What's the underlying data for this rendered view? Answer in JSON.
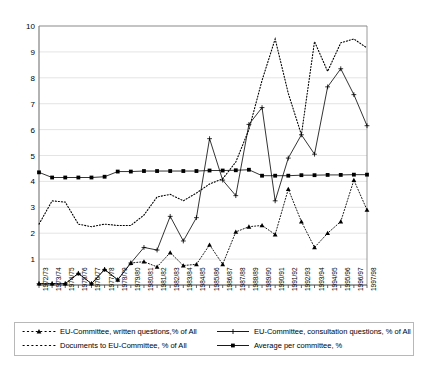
{
  "chart_data": {
    "type": "line",
    "title": "",
    "xlabel": "",
    "ylabel": "",
    "ylim": [
      0,
      10
    ],
    "ytick_step": 1,
    "grid": true,
    "legend_position": "bottom",
    "categories": [
      "1972/73",
      "1973/74",
      "1974/75",
      "1975/76",
      "1976/77",
      "1977/78",
      "1978/79",
      "1979/80",
      "1980/81",
      "1981/82",
      "1982/83",
      "1983/84",
      "1984/85",
      "1985/86",
      "1986/87",
      "1987/88",
      "1988/89",
      "1989/90",
      "1990/91",
      "1991/92",
      "1992/93",
      "1993/94",
      "1994/95",
      "1995/96",
      "1996/97",
      "1997/98"
    ],
    "ytick_labels": [
      "10",
      "9",
      "8",
      "7",
      "6",
      "5",
      "4",
      "3",
      "2",
      "1"
    ],
    "series": [
      {
        "name": "EU-Committee, written questions,% of All",
        "style": "dotted-triangle",
        "marker": "triangle",
        "values": [
          0.05,
          0.05,
          0.05,
          0.45,
          0.05,
          0.6,
          0.2,
          0.85,
          0.9,
          0.7,
          1.25,
          0.75,
          0.8,
          1.55,
          0.8,
          2.05,
          2.25,
          2.3,
          1.95,
          3.7,
          2.45,
          1.45,
          2.0,
          2.45,
          4.05,
          2.9
        ]
      },
      {
        "name": "Documents to EU-Committee, % of All",
        "style": "dotted-plain",
        "marker": "none",
        "values": [
          2.35,
          3.25,
          3.2,
          2.35,
          2.25,
          2.35,
          2.3,
          2.3,
          2.7,
          3.4,
          3.5,
          3.25,
          3.55,
          3.9,
          4.1,
          4.75,
          6.0,
          7.9,
          9.5,
          7.4,
          5.8,
          9.4,
          8.25,
          9.35,
          9.5,
          9.15
        ]
      },
      {
        "name": "EU-Committee, consultation questions, % of All",
        "style": "solid-plus",
        "marker": "plus",
        "values": [
          0.05,
          0.05,
          0.05,
          0.45,
          0.05,
          0.6,
          0.2,
          0.85,
          1.45,
          1.35,
          2.65,
          1.7,
          2.6,
          5.65,
          4.05,
          3.45,
          6.2,
          6.85,
          3.25,
          4.9,
          5.8,
          5.05,
          7.65,
          8.35,
          7.35,
          6.15
        ]
      },
      {
        "name": "Average per committee, %",
        "style": "solid-square",
        "marker": "square",
        "values": [
          4.35,
          4.15,
          4.15,
          4.15,
          4.15,
          4.18,
          4.38,
          4.38,
          4.4,
          4.4,
          4.4,
          4.4,
          4.4,
          4.42,
          4.42,
          4.43,
          4.45,
          4.22,
          4.22,
          4.22,
          4.24,
          4.24,
          4.25,
          4.25,
          4.26,
          4.26
        ]
      }
    ]
  },
  "legend": {
    "entries": [
      {
        "label": "EU-Committee, written questions,% of All",
        "marker": "triangle-marker",
        "style": "dotted"
      },
      {
        "label": "EU-Committee, consultation questions, % of All",
        "marker": "plus-marker",
        "style": "solid"
      },
      {
        "label": "Documents to EU-Committee, % of All",
        "marker": "dots-marker",
        "style": "dotted"
      },
      {
        "label": "Average per committee, %",
        "marker": "square-marker",
        "style": "solid"
      }
    ]
  }
}
